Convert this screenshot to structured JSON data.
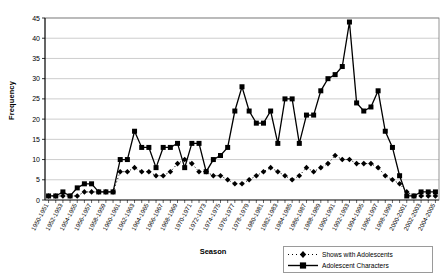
{
  "chart_data": {
    "type": "line",
    "title": "",
    "xlabel": "Season",
    "ylabel": "Frequency",
    "ylim": [
      0,
      45
    ],
    "ytick_step": 5,
    "yticks": [
      0,
      5,
      10,
      15,
      20,
      25,
      30,
      35,
      40,
      45
    ],
    "grid": true,
    "legend_position": "bottom-right",
    "categories": [
      "1950-1951",
      "1951-1952",
      "1952-1953",
      "1953-1954",
      "1954-1955",
      "1955-1956",
      "1956-1957",
      "1957-1958",
      "1958-1959",
      "1959-1960",
      "1960-1961",
      "1961-1962",
      "1962-1963",
      "1963-1964",
      "1964-1965",
      "1965-1966",
      "1966-1967",
      "1967-1968",
      "1968-1969",
      "1969-1970",
      "1970-1971",
      "1971-1972",
      "1972-1973",
      "1973-1974",
      "1974-1975",
      "1975-1976",
      "1976-1977",
      "1977-1978",
      "1978-1979",
      "1979-1980",
      "1980-1981",
      "1981-1982",
      "1982-1983",
      "1983-1984",
      "1984-1985",
      "1985-1986",
      "1986-1987",
      "1987-1988",
      "1988-1989",
      "1989-1990",
      "1990-1991",
      "1991-1992",
      "1992-1993",
      "1993-1994",
      "1994-1995",
      "1995-1996",
      "1996-1997",
      "1997-1998",
      "1998-1999",
      "1999-2000",
      "2000-2001",
      "2001-2002",
      "2002-2003",
      "2003-2004",
      "2004-2005"
    ],
    "xtick_labels": [
      "1950-1951",
      "1952-1953",
      "1954-1955",
      "1956-1957",
      "1958-1959",
      "1960-1961",
      "1962-1963",
      "1964-1965",
      "1966-1967",
      "1968-1969",
      "1970-1971",
      "1972-1973",
      "1974-1975",
      "1976-1977",
      "1978-1979",
      "1980-1981",
      "1982-1983",
      "1984-1985",
      "1986-1987",
      "1988-1989",
      "1990-1991",
      "1992-1993",
      "1994-1995",
      "1996-1997",
      "1998-1999",
      "2000-2001",
      "2002-2003",
      "2004-2005"
    ],
    "series": [
      {
        "name": "Shows with Adolescents",
        "marker": "diamond",
        "line": "dashed",
        "color": "#000000",
        "values": [
          1,
          1,
          1,
          1,
          1,
          2,
          2,
          2,
          2,
          2,
          7,
          7,
          8,
          7,
          7,
          6,
          6,
          7,
          9,
          10,
          9,
          7,
          7,
          6,
          6,
          5,
          4,
          4,
          5,
          6,
          7,
          8,
          7,
          6,
          5,
          6,
          8,
          7,
          8,
          9,
          11,
          10,
          10,
          9,
          9,
          9,
          8,
          6,
          5,
          4,
          2,
          1,
          1,
          1,
          1
        ]
      },
      {
        "name": "Adolescent Characters",
        "marker": "square",
        "line": "solid",
        "color": "#000000",
        "values": [
          1,
          1,
          2,
          1,
          3,
          4,
          4,
          2,
          2,
          2,
          10,
          10,
          17,
          13,
          13,
          8,
          13,
          13,
          14,
          8,
          14,
          14,
          7,
          10,
          11,
          13,
          22,
          28,
          22,
          19,
          19,
          22,
          14,
          25,
          25,
          14,
          21,
          21,
          27,
          30,
          31,
          33,
          44,
          24,
          22,
          23,
          27,
          17,
          13,
          6,
          1,
          1,
          2,
          2,
          2
        ]
      }
    ]
  }
}
